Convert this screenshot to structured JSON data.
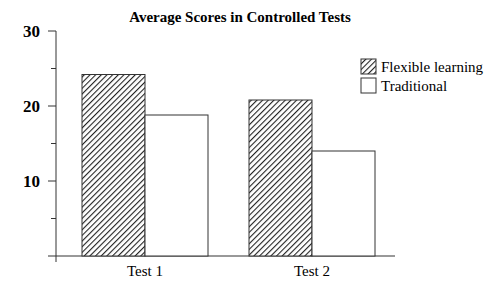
{
  "chart_data": {
    "type": "bar",
    "title": "Average Scores in Controlled Tests",
    "xlabel": "",
    "ylabel": "",
    "categories": [
      "Test 1",
      "Test 2"
    ],
    "series": [
      {
        "name": "Flexible learning",
        "values": [
          24.2,
          20.8
        ],
        "fill": "hatch"
      },
      {
        "name": "Traditional",
        "values": [
          18.8,
          14.0
        ],
        "fill": "#ffffff"
      }
    ],
    "ylim": [
      0,
      30
    ],
    "yticks_major": [
      10,
      20,
      30
    ],
    "yticks_minor": [
      5,
      15,
      25
    ],
    "grid": false,
    "legend_position": "right"
  },
  "colors": {
    "stroke": "#333333",
    "background": "#ffffff"
  }
}
